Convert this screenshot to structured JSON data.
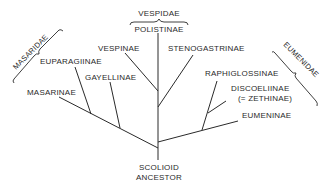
{
  "diagram": {
    "type": "phylogenetic-tree",
    "root": {
      "label_line1": "SCOLIOID",
      "label_line2": "ANCESTOR"
    },
    "families": {
      "masaridae": "MASARIDAE",
      "vespidae": "VESPIDAE",
      "eumenidae": "EUMENIDAE"
    },
    "taxa": {
      "masarinae": "MASARINAE",
      "euparagiinae": "EUPARAGIINAE",
      "gayellinae": "GAYELLINAE",
      "vespinae": "VESPINAE",
      "polistinae": "POLISTINAE",
      "stenogastrinae": "STENOGASTRINAE",
      "raphiglossinae": "RAPHIGLOSSINAE",
      "discoeliinae": "DISCOELIINAE",
      "discoeliinae_synonym": "(= ZETHINAE)",
      "eumeninae": "EUMENINAE"
    },
    "colors": {
      "line": "#2a2a2a",
      "background": "#ffffff"
    }
  }
}
